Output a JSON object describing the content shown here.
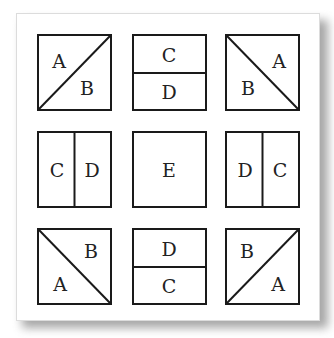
{
  "diagram": {
    "title": "",
    "grid": [
      {
        "id": "r1c1",
        "split": "diagonal-up",
        "labels": [
          {
            "text": "A",
            "pos": "top-left"
          },
          {
            "text": "B",
            "pos": "bottom-right"
          }
        ]
      },
      {
        "id": "r1c2",
        "split": "horizontal",
        "labels": [
          {
            "text": "C",
            "pos": "top"
          },
          {
            "text": "D",
            "pos": "bottom"
          }
        ]
      },
      {
        "id": "r1c3",
        "split": "diagonal-down",
        "labels": [
          {
            "text": "A",
            "pos": "top-right"
          },
          {
            "text": "B",
            "pos": "bottom-left"
          }
        ]
      },
      {
        "id": "r2c1",
        "split": "vertical",
        "labels": [
          {
            "text": "C",
            "pos": "left"
          },
          {
            "text": "D",
            "pos": "right"
          }
        ]
      },
      {
        "id": "r2c2",
        "split": "none",
        "labels": [
          {
            "text": "E",
            "pos": "center"
          }
        ]
      },
      {
        "id": "r2c3",
        "split": "vertical",
        "labels": [
          {
            "text": "D",
            "pos": "left"
          },
          {
            "text": "C",
            "pos": "right"
          }
        ]
      },
      {
        "id": "r3c1",
        "split": "diagonal-down",
        "labels": [
          {
            "text": "B",
            "pos": "top-right"
          },
          {
            "text": "A",
            "pos": "bottom-left"
          }
        ]
      },
      {
        "id": "r3c2",
        "split": "horizontal",
        "labels": [
          {
            "text": "D",
            "pos": "top"
          },
          {
            "text": "C",
            "pos": "bottom"
          }
        ]
      },
      {
        "id": "r3c3",
        "split": "diagonal-up",
        "labels": [
          {
            "text": "B",
            "pos": "top-left"
          },
          {
            "text": "A",
            "pos": "bottom-right"
          }
        ]
      }
    ],
    "colors": {
      "stroke": "#1a1a1a",
      "text": "#222222",
      "background": "#ffffff"
    }
  }
}
